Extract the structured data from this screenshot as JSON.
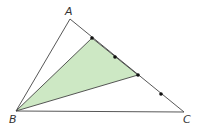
{
  "diagram": {
    "labels": {
      "A": "A",
      "B": "B",
      "C": "C"
    },
    "colors": {
      "stroke": "#444444",
      "fill": "#cde8c4",
      "point": "#111111"
    },
    "vertices": {
      "A": [
        70,
        19
      ],
      "B": [
        16,
        111
      ],
      "C": [
        184,
        112
      ]
    },
    "points_on_AC": [
      [
        92,
        38
      ],
      [
        115,
        57
      ],
      [
        138,
        75
      ],
      [
        161,
        94
      ]
    ],
    "shaded_triangle": "B, first point, third point on AC"
  }
}
